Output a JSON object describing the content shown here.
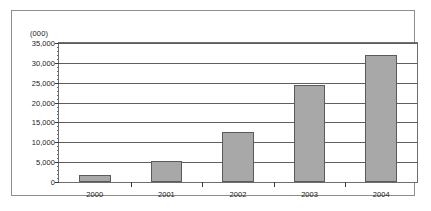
{
  "figure": {
    "units_caption": "(000)"
  },
  "chart_data": {
    "type": "bar",
    "title": "",
    "subtitle": "",
    "xlabel": "",
    "ylabel": "",
    "units_note": "(000)",
    "categories": [
      "2000",
      "2001",
      "2002",
      "2003",
      "2004"
    ],
    "values": [
      1800,
      5300,
      12500,
      24400,
      31900
    ],
    "series": [
      {
        "name": "",
        "values": [
          1800,
          5300,
          12500,
          24400,
          31900
        ]
      }
    ],
    "ylim": [
      0,
      35000
    ],
    "ytick_values": [
      0,
      5000,
      10000,
      15000,
      20000,
      25000,
      30000,
      35000
    ],
    "ytick_labels": [
      "0",
      "5,000",
      "10,000",
      "15,000",
      "20,000",
      "25,000",
      "30,000",
      "35,000"
    ],
    "ytick_minor_interval": 1000,
    "grid": true,
    "grid_axis": "y",
    "legend": false,
    "legend_position": "none",
    "bar_color": "#a8a8a8",
    "bar_edge_color": "#5a5a5a",
    "axis_color": "#6e6e6e",
    "grid_color": "#5f5f5f",
    "text_color": "#1a1a1a",
    "background_color": "#ffffff",
    "annotations": []
  }
}
